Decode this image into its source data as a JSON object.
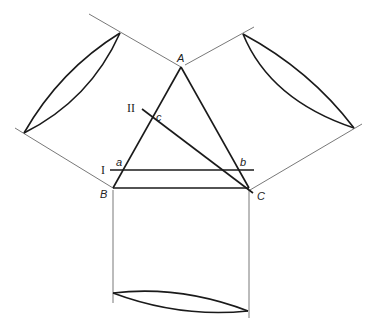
{
  "diagram": {
    "labels": {
      "A": "A",
      "B": "B",
      "C": "C",
      "a": "a",
      "b": "b",
      "c": "c",
      "line_I": "I",
      "line_II": "II"
    },
    "vertices": {
      "A": [
        181,
        67
      ],
      "B": [
        113,
        188
      ],
      "C": [
        248,
        188
      ]
    },
    "colors": {
      "stroke": "#1a1a1a",
      "thin_stroke": "#555555",
      "background": "#ffffff"
    }
  }
}
